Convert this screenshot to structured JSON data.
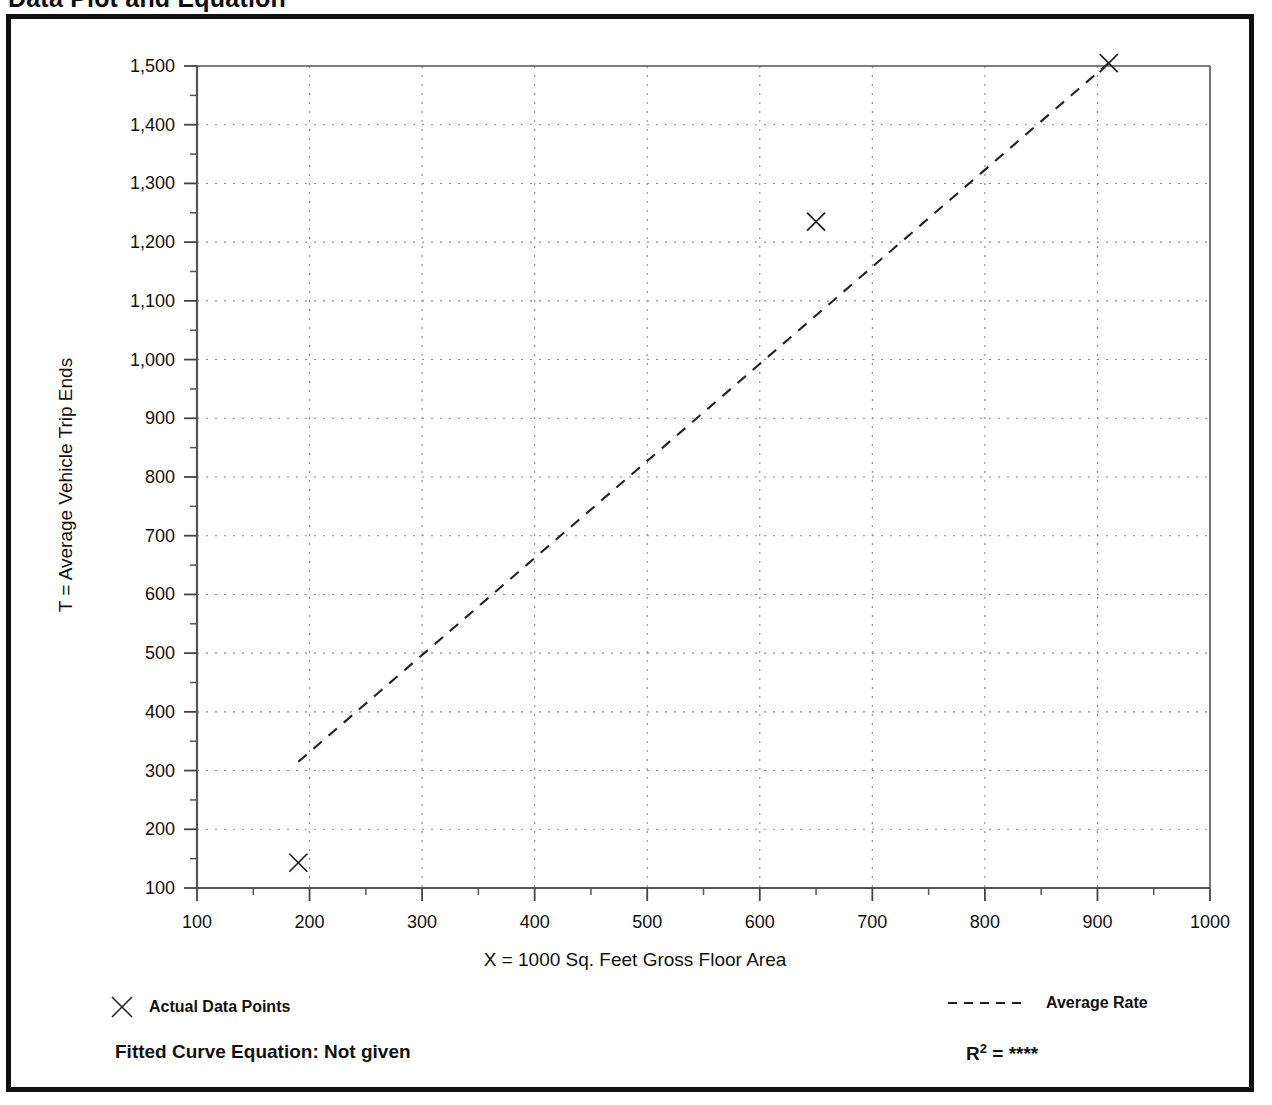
{
  "page": {
    "title": "Data Plot and Equation",
    "title_right": ""
  },
  "axis": {
    "y_title": "T = Average Vehicle Trip Ends",
    "x_title": "X = 1000 Sq. Feet Gross Floor Area"
  },
  "legend": {
    "data_points_label": "Actual Data Points",
    "data_points_icon": "x-marker-icon",
    "average_rate_label": "Average Rate",
    "average_rate_icon": "dashed-line-icon"
  },
  "equation": {
    "fitted_label": "Fitted Curve Equation:  Not given",
    "r_squared_prefix": "R",
    "r_squared_exponent": "2",
    "r_squared_equals": " = ",
    "r_squared_value": "****"
  },
  "colors": {
    "ink": "#111111",
    "grid": "#8a8a8a",
    "axis": "#444444"
  },
  "chart_data": {
    "type": "scatter",
    "title": "Data Plot and Equation",
    "xlabel": "X = 1000 Sq. Feet Gross Floor Area",
    "ylabel": "T = Average Vehicle Trip Ends",
    "xlim": [
      100,
      1000
    ],
    "ylim": [
      100,
      1500
    ],
    "xticks": [
      100,
      200,
      300,
      400,
      500,
      600,
      700,
      800,
      900,
      1000
    ],
    "xtick_labels": [
      "100",
      "200",
      "300",
      "400",
      "500",
      "600",
      "700",
      "800",
      "900",
      "1000"
    ],
    "yticks": [
      100,
      200,
      300,
      400,
      500,
      600,
      700,
      800,
      900,
      1000,
      1100,
      1200,
      1300,
      1400,
      1500
    ],
    "ytick_labels": [
      "100",
      "200",
      "300",
      "400",
      "500",
      "600",
      "700",
      "800",
      "900",
      "1,000",
      "1,100",
      "1,200",
      "1,300",
      "1,400",
      "1,500"
    ],
    "minor_tick_step_x": 50,
    "minor_tick_step_y": 50,
    "grid": true,
    "grid_style": "dotted",
    "legend": [
      "Actual Data Points",
      "Average Rate"
    ],
    "legend_position": "below-axes",
    "series": [
      {
        "name": "Actual Data Points",
        "type": "scatter",
        "marker": "x",
        "points": [
          {
            "x": 190,
            "y": 143
          },
          {
            "x": 650,
            "y": 1235
          },
          {
            "x": 910,
            "y": 1505
          }
        ]
      },
      {
        "name": "Average Rate",
        "type": "line",
        "style": "dashed",
        "points": [
          {
            "x": 190,
            "y": 315
          },
          {
            "x": 910,
            "y": 1505
          }
        ]
      }
    ],
    "annotations": {
      "fitted_curve_equation": "Not given",
      "r_squared": "****"
    }
  }
}
